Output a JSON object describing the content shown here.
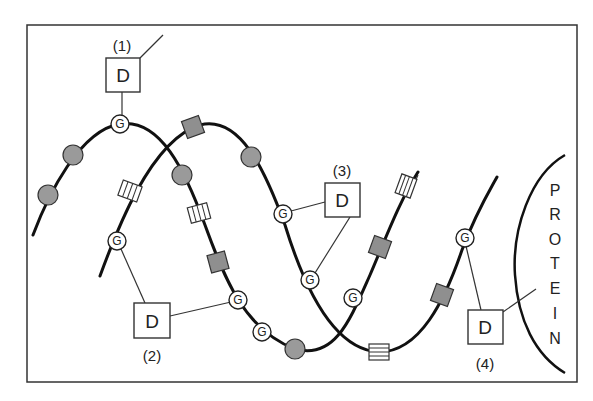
{
  "diagram": {
    "labels": {
      "site1": "(1)",
      "site2": "(2)",
      "site3": "(3)",
      "site4": "(4)"
    },
    "d_boxes": [
      {
        "id": "1",
        "text": "D"
      },
      {
        "id": "2",
        "text": "D"
      },
      {
        "id": "3",
        "text": "D"
      },
      {
        "id": "4",
        "text": "D"
      }
    ],
    "g_residue_text": "G",
    "g_residues": [
      {
        "strand": "A",
        "text": "G"
      },
      {
        "strand": "A",
        "text": "G"
      },
      {
        "strand": "A",
        "text": "G"
      },
      {
        "strand": "A",
        "text": "G"
      },
      {
        "strand": "B",
        "text": "G"
      },
      {
        "strand": "B",
        "text": "G"
      },
      {
        "strand": "B",
        "text": "G"
      },
      {
        "strand": "B",
        "text": "G"
      }
    ],
    "protein": {
      "letters": [
        "P",
        "R",
        "O",
        "T",
        "E",
        "I",
        "N"
      ]
    },
    "colors": {
      "stroke": "#111111",
      "gray_monomer": "#9a9a9a",
      "background": "#ffffff"
    }
  }
}
